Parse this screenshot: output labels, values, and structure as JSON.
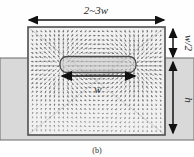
{
  "figure": {
    "name": "magnetic-field-simulation-schematic",
    "caption": "(b)",
    "background": "#fefefe"
  },
  "labels": {
    "top_width": "2~3w",
    "right_upper": "w/2",
    "right_lower": "h",
    "center_width": "w"
  },
  "colors": {
    "outline": "#555555",
    "band_fill": "#d6d6d6",
    "domain_fill": "#f2f2f2",
    "inner_fill": "#cfcfcf",
    "arrow": "#1a1a1a",
    "vector": "#6f6f6f",
    "diagonal": "#b9b9b9"
  },
  "geometry": {
    "domain": {
      "x": 28,
      "y": 27,
      "w": 137,
      "h": 108
    },
    "band": {
      "x": 0,
      "y": 58,
      "w": 194,
      "h": 82
    },
    "inner": {
      "x": 60,
      "y": 57,
      "w": 76,
      "h": 16
    },
    "vector_grid": {
      "cols": 30,
      "rows": 24,
      "glyph": "arrow"
    }
  },
  "dimension_arrows": [
    {
      "name": "top-width-arrow",
      "orientation": "horizontal",
      "label": "2~3w"
    },
    {
      "name": "right-upper-arrow",
      "orientation": "vertical",
      "label": "w/2"
    },
    {
      "name": "right-lower-arrow",
      "orientation": "vertical",
      "label": "h"
    },
    {
      "name": "center-width-arrow",
      "orientation": "horizontal",
      "label": "w"
    }
  ],
  "icon_names": {
    "arrow_double": "double-headed-arrow-icon",
    "vector_field": "vector-field-icon"
  }
}
